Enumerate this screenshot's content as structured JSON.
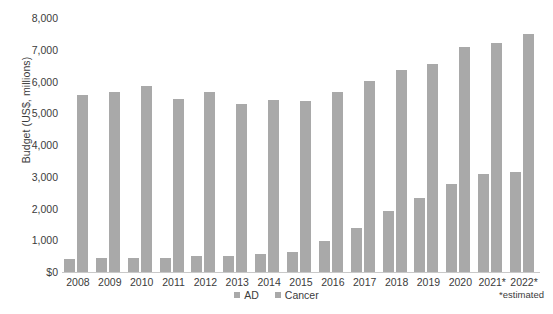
{
  "chart_data": {
    "type": "bar",
    "title": "",
    "subtitle": "",
    "xlabel": "",
    "ylabel": "Budget (US$, millions)",
    "ylim": [
      0,
      8000
    ],
    "ytick_labels": [
      "8,000",
      "7,000",
      "6,000",
      "5,000",
      "4,000",
      "3,000",
      "2,000",
      "1,000",
      "$0"
    ],
    "ytick_values": [
      8000,
      7000,
      6000,
      5000,
      4000,
      3000,
      2000,
      1000,
      0
    ],
    "grid": false,
    "legend_position": "bottom-center",
    "categories": [
      "2008",
      "2009",
      "2010",
      "2011",
      "2012",
      "2013",
      "2014",
      "2015",
      "2016",
      "2017",
      "2018",
      "2019",
      "2020",
      "2021*",
      "2022*"
    ],
    "series": [
      {
        "name": "AD",
        "color": "#a9a9a9",
        "values": [
          412,
          448,
          450,
          448,
          503,
          504,
          562,
          631,
          991,
          1391,
          1908,
          2323,
          2783,
          3080,
          3160
        ]
      },
      {
        "name": "Cancer",
        "color": "#a9a9a9",
        "values": [
          5580,
          5670,
          5850,
          5450,
          5680,
          5290,
          5420,
          5400,
          5670,
          6030,
          6360,
          6560,
          7090,
          7220,
          7500
        ]
      }
    ],
    "annotations": [
      "*estimated"
    ]
  },
  "legend": {
    "items": [
      {
        "label": "AD"
      },
      {
        "label": "Cancer"
      }
    ]
  },
  "footnote": "*estimated",
  "colors": {
    "bar": "#a9a9a9",
    "axis": "#c9c9c9",
    "text": "#3b3b3b",
    "background": "#ffffff"
  }
}
